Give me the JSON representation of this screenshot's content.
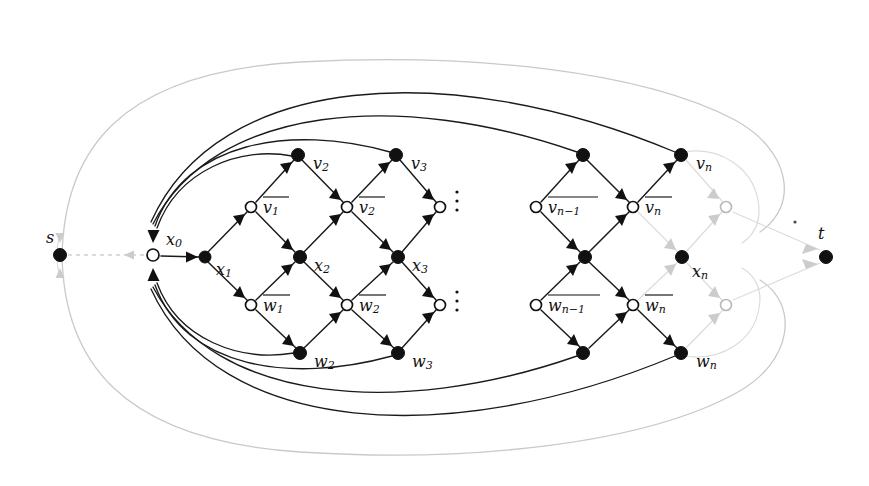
{
  "figure": {
    "type": "directed-graph-diagram",
    "width": 869,
    "height": 486,
    "background": "#ffffff",
    "colors": {
      "edge_dark": "#1a1a1a",
      "edge_faint": "#c9c9c9",
      "node_fill": "#111111",
      "node_stroke": "#111111",
      "node_hollow_fill": "#ffffff",
      "label": "#111111"
    }
  },
  "labels": {
    "source": "s",
    "sink": "t",
    "x0": "x",
    "x0_sub": "0",
    "x1": "x",
    "x1_sub": "1",
    "x2": "x",
    "x2_sub": "2",
    "x3": "x",
    "x3_sub": "3",
    "xn": "x",
    "xn_sub": "n",
    "v2": "v",
    "v2_sub": "2",
    "v3": "v",
    "v3_sub": "3",
    "vn": "v",
    "vn_sub": "n",
    "w2": "w",
    "w2_sub": "2",
    "w3": "w",
    "w3_sub": "3",
    "wn": "w",
    "wn_sub": "n",
    "vbar1": "v",
    "vbar1_sub": "1",
    "vbar2": "v",
    "vbar2_sub": "2",
    "vbarnm1": "v",
    "vbarnm1_sub": "n−1",
    "vbarn": "v",
    "vbarn_sub": "n",
    "wbar1": "w",
    "wbar1_sub": "1",
    "wbar2": "w",
    "wbar2_sub": "2",
    "wbarnm1": "w",
    "wbarnm1_sub": "n−1",
    "wbarn": "w",
    "wbarn_sub": "n"
  },
  "nodes": [
    {
      "id": "s",
      "label": "s",
      "x": 60,
      "y": 255,
      "shape": "filled",
      "tone": "dark",
      "label_dx": -10,
      "label_dy": -18
    },
    {
      "id": "x0",
      "label": "x0",
      "x": 153,
      "y": 255,
      "shape": "hollow",
      "tone": "dark",
      "label_dx": 12,
      "label_dy": -16
    },
    {
      "id": "x1",
      "label": "x1",
      "x": 205,
      "y": 257,
      "shape": "filled",
      "tone": "dark",
      "label_dx": 14,
      "label_dy": 12
    },
    {
      "id": "vbar1",
      "label": "vbar1",
      "x": 251,
      "y": 207,
      "shape": "hollow",
      "tone": "dark",
      "label_dx": 12,
      "label_dy": 0
    },
    {
      "id": "wbar1",
      "label": "wbar1",
      "x": 251,
      "y": 305,
      "shape": "hollow",
      "tone": "dark",
      "label_dx": 12,
      "label_dy": 0
    },
    {
      "id": "v2",
      "label": "v2",
      "x": 298,
      "y": 155,
      "shape": "filled",
      "tone": "dark",
      "label_dx": 14,
      "label_dy": 8
    },
    {
      "id": "x2",
      "label": "x2",
      "x": 300,
      "y": 257,
      "shape": "filled",
      "tone": "dark",
      "label_dx": 14,
      "label_dy": 8
    },
    {
      "id": "w2",
      "label": "w2",
      "x": 300,
      "y": 353,
      "shape": "filled",
      "tone": "dark",
      "label_dx": 14,
      "label_dy": 8
    },
    {
      "id": "vbar2",
      "label": "vbar2",
      "x": 347,
      "y": 207,
      "shape": "hollow",
      "tone": "dark",
      "label_dx": 12,
      "label_dy": 0
    },
    {
      "id": "wbar2",
      "label": "wbar2",
      "x": 347,
      "y": 305,
      "shape": "hollow",
      "tone": "dark",
      "label_dx": 12,
      "label_dy": 0
    },
    {
      "id": "v3",
      "label": "v3",
      "x": 396,
      "y": 155,
      "shape": "filled",
      "tone": "dark",
      "label_dx": 14,
      "label_dy": 8
    },
    {
      "id": "x3",
      "label": "x3",
      "x": 398,
      "y": 257,
      "shape": "filled",
      "tone": "dark",
      "label_dx": 14,
      "label_dy": 8
    },
    {
      "id": "w3",
      "label": "w3",
      "x": 398,
      "y": 353,
      "shape": "filled",
      "tone": "dark",
      "label_dx": 14,
      "label_dy": 8
    },
    {
      "id": "vbar3",
      "label": "",
      "x": 440,
      "y": 207,
      "shape": "hollow",
      "tone": "dark",
      "label_dx": 0,
      "label_dy": 0
    },
    {
      "id": "wbar3",
      "label": "",
      "x": 440,
      "y": 305,
      "shape": "hollow",
      "tone": "dark",
      "label_dx": 0,
      "label_dy": 0
    },
    {
      "id": "vbarnm1",
      "label": "vbarnm1",
      "x": 536,
      "y": 207,
      "shape": "hollow",
      "tone": "dark",
      "label_dx": 12,
      "label_dy": 0
    },
    {
      "id": "wbarnm1",
      "label": "wbarnm1",
      "x": 536,
      "y": 305,
      "shape": "hollow",
      "tone": "dark",
      "label_dx": 12,
      "label_dy": 0
    },
    {
      "id": "vnm1",
      "label": "",
      "x": 583,
      "y": 155,
      "shape": "filled",
      "tone": "dark",
      "label_dx": 0,
      "label_dy": 0
    },
    {
      "id": "xnm1",
      "label": "",
      "x": 585,
      "y": 257,
      "shape": "filled",
      "tone": "dark",
      "label_dx": 0,
      "label_dy": 0
    },
    {
      "id": "wnm1",
      "label": "",
      "x": 583,
      "y": 353,
      "shape": "filled",
      "tone": "dark",
      "label_dx": 0,
      "label_dy": 0
    },
    {
      "id": "vbarn",
      "label": "vbarn",
      "x": 633,
      "y": 207,
      "shape": "hollow",
      "tone": "dark",
      "label_dx": 12,
      "label_dy": 0
    },
    {
      "id": "wbarn",
      "label": "wbarn",
      "x": 633,
      "y": 305,
      "shape": "hollow",
      "tone": "dark",
      "label_dx": 12,
      "label_dy": 0
    },
    {
      "id": "vn",
      "label": "vn",
      "x": 681,
      "y": 155,
      "shape": "filled",
      "tone": "dark",
      "label_dx": 14,
      "label_dy": 8
    },
    {
      "id": "xn",
      "label": "xn",
      "x": 682,
      "y": 257,
      "shape": "filled",
      "tone": "dark",
      "label_dx": 10,
      "label_dy": 14
    },
    {
      "id": "wn",
      "label": "wn",
      "x": 681,
      "y": 353,
      "shape": "filled",
      "tone": "dark",
      "label_dx": 14,
      "label_dy": 8
    },
    {
      "id": "vtail",
      "label": "",
      "x": 726,
      "y": 207,
      "shape": "hollow",
      "tone": "faint",
      "label_dx": 0,
      "label_dy": 0
    },
    {
      "id": "wtail",
      "label": "",
      "x": 726,
      "y": 305,
      "shape": "hollow",
      "tone": "faint",
      "label_dx": 0,
      "label_dy": 0
    },
    {
      "id": "t",
      "label": "t",
      "x": 826,
      "y": 257,
      "shape": "filled",
      "tone": "dark",
      "label_dx": -6,
      "label_dy": -22
    }
  ],
  "ellipses": [
    {
      "id": "ellipsis-upper",
      "x": 455,
      "y": 200
    },
    {
      "id": "ellipsis-lower",
      "x": 455,
      "y": 300
    }
  ],
  "annotations": {
    "stray_dot": {
      "x": 795,
      "y": 222
    }
  },
  "edge_groups": {
    "lattice_dark": "solid black arrows forming diamond lattice",
    "feedback_arcs": "four long dark arcs above and four below returning into x0",
    "faint_tail": "light gray edges for the final x_n stage and s-t connections",
    "faint_boundary": "light gray outer envelope curves"
  },
  "counts": {
    "dark_top_arcs": 4,
    "dark_bottom_arcs": 4,
    "lattice_columns": 6,
    "vertical_ellipses": 2
  }
}
